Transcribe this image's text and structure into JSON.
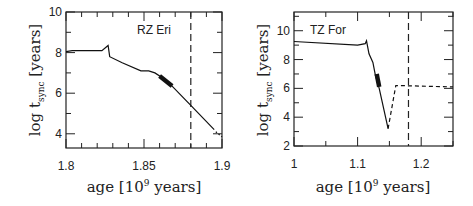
{
  "chart_data": [
    {
      "type": "line",
      "title": "",
      "annotation": "RZ Eri",
      "xlabel": "age [10^9 years]",
      "xlabel_parts": {
        "pre": "age [10",
        "sup": "9",
        "post": " years]"
      },
      "ylabel_parts": {
        "pre": "log t",
        "sub": "sync",
        "post": " [years]"
      },
      "xlim": [
        1.8,
        1.9
      ],
      "ylim": [
        3.3,
        10
      ],
      "xticks": [
        1.8,
        1.85,
        1.9
      ],
      "xtick_labels": [
        "1.8",
        "1.85",
        "1.9"
      ],
      "yticks": [
        4,
        6,
        8,
        10
      ],
      "ytick_labels": [
        "4",
        "6",
        "8",
        "10"
      ],
      "grid": false,
      "vline_dashed_x": 1.88,
      "series": [
        {
          "name": "t_sync",
          "style": "solid",
          "x": [
            1.8,
            1.804,
            1.823,
            1.827,
            1.828,
            1.836,
            1.848,
            1.853,
            1.857,
            1.862,
            1.868,
            1.88,
            1.895
          ],
          "y": [
            8.05,
            8.1,
            8.1,
            8.35,
            7.8,
            7.5,
            7.1,
            7.1,
            7.0,
            6.75,
            6.35,
            5.4,
            4.2
          ]
        },
        {
          "name": "observed range",
          "style": "thick",
          "x": [
            1.86,
            1.868
          ],
          "y": [
            6.85,
            6.35
          ]
        },
        {
          "name": "extension",
          "style": "dotted",
          "x": [
            1.896,
            1.9
          ],
          "y": [
            4.1,
            3.85
          ]
        }
      ]
    },
    {
      "type": "line",
      "title": "",
      "annotation": "TZ For",
      "xlabel": "age [10^9 years]",
      "xlabel_parts": {
        "pre": "age [10",
        "sup": "9",
        "post": " years]"
      },
      "ylabel_parts": {
        "pre": "log t",
        "sub": "sync",
        "post": " [years]"
      },
      "xlim": [
        1.0,
        1.25
      ],
      "ylim": [
        2,
        11.3
      ],
      "xticks": [
        1.0,
        1.1,
        1.2
      ],
      "xtick_labels": [
        "1",
        "1.1",
        "1.2"
      ],
      "yticks": [
        2,
        4,
        6,
        8,
        10
      ],
      "ytick_labels": [
        "2",
        "4",
        "6",
        "8",
        "10"
      ],
      "grid": false,
      "vline_dashed_x": 1.18,
      "series": [
        {
          "name": "t_sync",
          "style": "solid",
          "x": [
            1.0,
            1.1,
            1.112,
            1.114,
            1.118,
            1.124,
            1.128,
            1.134,
            1.148
          ],
          "y": [
            9.25,
            9.0,
            9.1,
            9.3,
            8.4,
            7.8,
            6.9,
            6.0,
            3.2
          ]
        },
        {
          "name": "observed range",
          "style": "thick",
          "x": [
            1.13,
            1.134
          ],
          "y": [
            7.0,
            6.1
          ]
        },
        {
          "name": "post-minimum",
          "style": "dashed",
          "x": [
            1.148,
            1.16,
            1.25
          ],
          "y": [
            3.2,
            6.2,
            6.1
          ]
        }
      ]
    }
  ]
}
